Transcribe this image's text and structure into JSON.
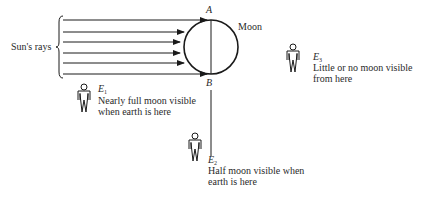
{
  "diagram": {
    "rays_label": "Sun's rays",
    "moon_label": "Moon",
    "point_a": "A",
    "point_b": "B",
    "observers": [
      {
        "id": "E",
        "sub": "1",
        "caption_line1": "Nearly full moon visible",
        "caption_line2": "when earth is here"
      },
      {
        "id": "E",
        "sub": "2",
        "caption_line1": "Half moon visible when",
        "caption_line2": "earth is here"
      },
      {
        "id": "E",
        "sub": "3",
        "caption_line1": "Little or no moon visible",
        "caption_line2": "from here"
      }
    ],
    "ray_count": 6,
    "stroke_color": "#1a1a1a"
  }
}
